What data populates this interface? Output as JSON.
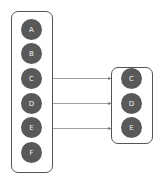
{
  "diagram": {
    "source_group": {
      "nodes": [
        {
          "label": "A"
        },
        {
          "label": "B"
        },
        {
          "label": "C"
        },
        {
          "label": "D"
        },
        {
          "label": "E"
        },
        {
          "label": "F"
        }
      ]
    },
    "target_group": {
      "nodes": [
        {
          "label": "C"
        },
        {
          "label": "D"
        },
        {
          "label": "E"
        }
      ]
    },
    "edges": [
      {
        "from": "C",
        "to": "C"
      },
      {
        "from": "D",
        "to": "D"
      },
      {
        "from": "E",
        "to": "E"
      }
    ],
    "colors": {
      "node_fill": "#595959",
      "node_text": "#f2f2f2",
      "border": "#555555",
      "arrow": "#777777"
    }
  }
}
